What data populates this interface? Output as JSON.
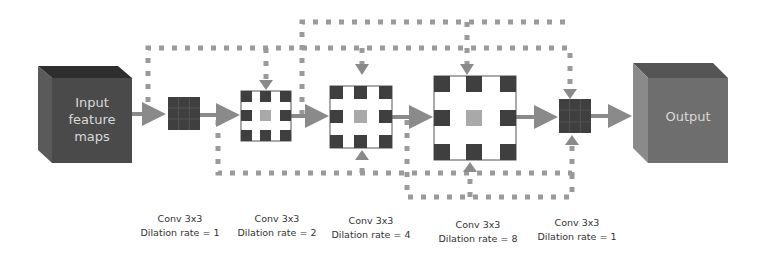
{
  "diagram": {
    "input": {
      "label_lines": [
        "Input",
        "feature",
        "maps"
      ]
    },
    "output": {
      "label": "Output"
    },
    "layers": [
      {
        "name": "Conv 3x3",
        "dilation": "Dilation rate = 1"
      },
      {
        "name": "Conv 3x3",
        "dilation": "Dilation rate = 2"
      },
      {
        "name": "Conv 3x3",
        "dilation": "Dilation rate = 4"
      },
      {
        "name": "Conv 3x3",
        "dilation": "Dilation rate = 8"
      },
      {
        "name": "Conv 3x3",
        "dilation": "Dilation rate = 1"
      }
    ],
    "colors": {
      "cube_front": "#4a4a4a",
      "cube_output": "#6e6e6e",
      "kernel_dark": "#3f3f3f",
      "kernel_center": "#a9a9a9",
      "arrow": "#8a8a8a",
      "dash": "#9a9a9a"
    }
  }
}
